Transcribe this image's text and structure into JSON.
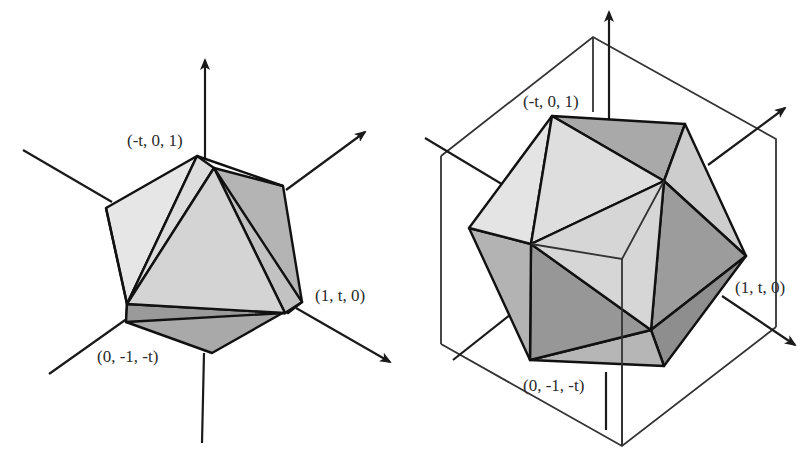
{
  "figure": {
    "panels": [
      {
        "id": "left",
        "description": "Icosahedron with three coordinate axes, golden rectangle inscribed",
        "labels": {
          "top": "(-t, 0, 1)",
          "right": "(1, t, 0)",
          "bottom": "(0, -1, -t)"
        }
      },
      {
        "id": "right",
        "description": "Icosahedron inscribed in a cube with coordinate axes",
        "labels": {
          "top": "(-t, 0, 1)",
          "right": "(1, t, 0)",
          "bottom": "(0, -1, -t)"
        }
      }
    ],
    "colors": {
      "background": "#ffffff",
      "face_light": "#e6e6e6",
      "face_mid": "#cfcfcf",
      "face_dark": "#a8a8a8",
      "face_darker": "#969696",
      "stroke": "#111111"
    }
  }
}
